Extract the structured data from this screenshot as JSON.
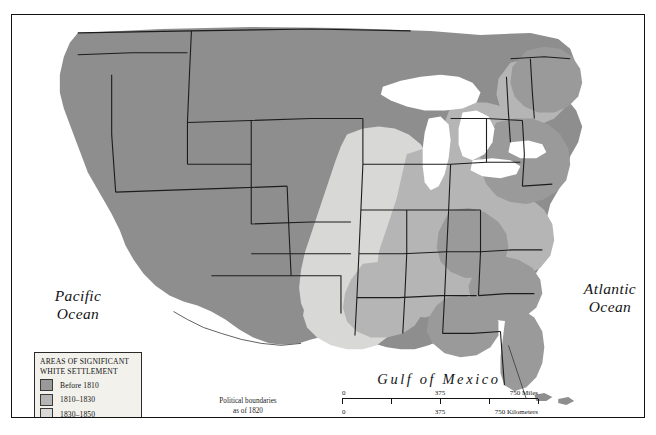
{
  "figure": {
    "kind": "historical-thematic-map"
  },
  "labels": {
    "pacific_ocean_line1": "Pacific",
    "pacific_ocean_line2": "Ocean",
    "atlantic_ocean_line1": "Atlantic",
    "atlantic_ocean_line2": "Ocean",
    "gulf_of_mexico": "Gulf of Mexico",
    "boundary_note_line1": "Political boundaries",
    "boundary_note_line2": "as of 1820"
  },
  "legend": {
    "title_line1": "AREAS OF SIGNIFICANT",
    "title_line2": "WHITE SETTLEMENT",
    "items": [
      {
        "label": "Before 1810",
        "color": "#9a9a9a"
      },
      {
        "label": "1810–1830",
        "color": "#b5b5b5"
      },
      {
        "label": "1830–1850",
        "color": "#d8d8d6"
      }
    ]
  },
  "scale": {
    "miles": {
      "min": "0",
      "mid": "375",
      "max": "750 Miles"
    },
    "kilometers": {
      "min": "0",
      "mid": "375",
      "max": "750 Kilometers"
    }
  },
  "colors": {
    "ocean": "#ffffff",
    "land_base": "#cfcfcd",
    "unsettled_territory": "#8e8e8e",
    "settled_before_1810": "#9a9a9a",
    "settled_1810_1830": "#b5b5b5",
    "settled_1830_1850": "#d8d8d6",
    "lakes": "#ffffff",
    "boundary_line": "#1c1c1c",
    "frame": "#111111"
  }
}
